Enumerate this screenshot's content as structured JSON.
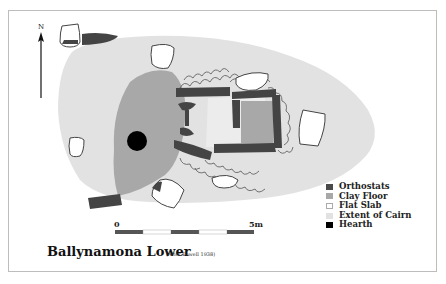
{
  "figure": {
    "title": "Ballynamona Lower",
    "credit": "(After Powell 1938)",
    "north_label": "N"
  },
  "scale_bar": {
    "start_label": "0",
    "end_label": "5m"
  },
  "legend": {
    "items": [
      {
        "label": "Orthostats",
        "color": "#4a4a4a"
      },
      {
        "label": "Clay Floor",
        "color": "#a8a8a8"
      },
      {
        "label": "Flat Slab",
        "color": "#ffffff"
      },
      {
        "label": "Extent of Cairn",
        "color": "#e2e2e2"
      },
      {
        "label": "Hearth",
        "color": "#000000"
      }
    ]
  },
  "colors": {
    "cairn": "#e2e2e2",
    "clay_floor": "#a8a8a8",
    "orthostat": "#444444",
    "hearth": "#000000",
    "outline": "#444444",
    "frame": "#bdbdbd"
  }
}
